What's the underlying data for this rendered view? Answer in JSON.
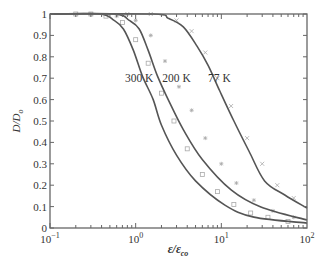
{
  "chart_data": {
    "type": "line",
    "title": "",
    "xlabel": "ε/ε_co",
    "ylabel": "D/D_o",
    "xscale": "log",
    "xlim": [
      0.1,
      100
    ],
    "ylim": [
      0,
      1
    ],
    "grid": false,
    "legend": "inline labels",
    "x_ticks": [
      {
        "value": 0.1,
        "base": "10",
        "exp": "−1"
      },
      {
        "value": 1,
        "base": "10",
        "exp": "0"
      },
      {
        "value": 10,
        "base": "10",
        "exp": "1"
      },
      {
        "value": 100,
        "base": "10",
        "exp": "2"
      }
    ],
    "y_ticks": [
      "0",
      "0.1",
      "0.2",
      "0.3",
      "0.4",
      "0.5",
      "0.6",
      "0.7",
      "0.8",
      "0.9",
      "1"
    ],
    "series": [
      {
        "name": "300 K",
        "marker": "square",
        "x": [
          0.1,
          0.38,
          0.56,
          0.72,
          0.94,
          1.2,
          1.6,
          2.0,
          3.0,
          5.0,
          11.0,
          24.0,
          100
        ],
        "y": [
          1.0,
          1.0,
          0.97,
          0.93,
          0.83,
          0.71,
          0.6,
          0.48,
          0.34,
          0.22,
          0.107,
          0.051,
          0.023
        ]
      },
      {
        "name": "200 K",
        "marker": "asterisk",
        "x": [
          0.1,
          0.56,
          0.84,
          1.1,
          1.4,
          1.8,
          2.4,
          3.6,
          6.0,
          13.0,
          29.0,
          100
        ],
        "y": [
          1.0,
          1.0,
          0.97,
          0.93,
          0.83,
          0.71,
          0.6,
          0.46,
          0.32,
          0.178,
          0.098,
          0.037
        ]
      },
      {
        "name": "77 K",
        "marker": "x",
        "x": [
          0.1,
          1.6,
          2.4,
          3.6,
          5.2,
          7.0,
          9.6,
          14.0,
          21.0,
          32.0,
          55.0,
          100
        ],
        "y": [
          1.0,
          1.0,
          0.98,
          0.94,
          0.85,
          0.76,
          0.64,
          0.5,
          0.36,
          0.22,
          0.154,
          0.093
        ]
      }
    ],
    "scatter_points": [
      {
        "series": "300 K",
        "x": [
          0.2,
          0.3,
          0.45,
          0.7,
          1.0,
          1.4,
          2.0,
          2.8,
          4.0,
          6.0,
          9.0,
          14,
          22,
          35,
          60
        ],
        "y": [
          1.0,
          1.0,
          0.99,
          0.96,
          0.88,
          0.77,
          0.63,
          0.5,
          0.37,
          0.25,
          0.17,
          0.11,
          0.07,
          0.05,
          0.03
        ]
      },
      {
        "series": "200 K",
        "x": [
          0.3,
          0.6,
          1.0,
          1.5,
          2.2,
          3.2,
          4.5,
          6.5,
          10,
          15,
          24,
          40,
          70
        ],
        "y": [
          1.0,
          0.99,
          0.97,
          0.9,
          0.78,
          0.66,
          0.55,
          0.42,
          0.3,
          0.21,
          0.13,
          0.08,
          0.05
        ]
      },
      {
        "series": "77 K",
        "x": [
          0.8,
          1.5,
          3.0,
          4.5,
          6.5,
          9.0,
          13,
          20,
          30,
          45,
          70
        ],
        "y": [
          1.0,
          1.0,
          0.97,
          0.92,
          0.82,
          0.7,
          0.57,
          0.42,
          0.3,
          0.2,
          0.14
        ]
      }
    ],
    "annotations": [
      {
        "text": "300 K",
        "x": 1.1,
        "y": 0.7
      },
      {
        "text": "200 K",
        "x": 3.0,
        "y": 0.7
      },
      {
        "text": "77 K",
        "x": 9.5,
        "y": 0.7
      }
    ],
    "colors": {
      "curve": "#555555",
      "marker": "#aaaaaa",
      "axis": "#666666",
      "text": "#333333"
    }
  }
}
